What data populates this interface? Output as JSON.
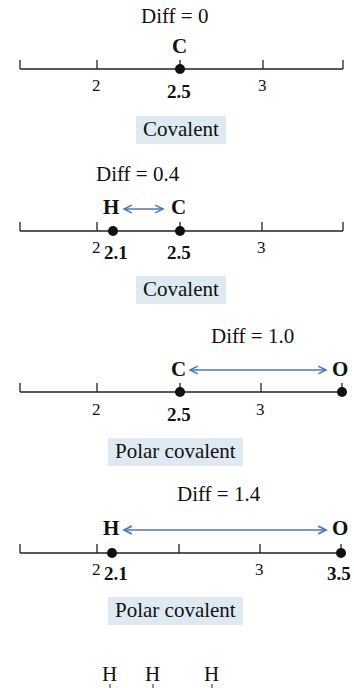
{
  "panels": [
    {
      "diff_label": "Diff = 0",
      "atoms": [
        {
          "symbol": "C",
          "value": "2.5"
        }
      ],
      "bond_type": "Covalent"
    },
    {
      "diff_label": "Diff = 0.4",
      "atoms": [
        {
          "symbol": "H",
          "value": "2.1"
        },
        {
          "symbol": "C",
          "value": "2.5"
        }
      ],
      "bond_type": "Covalent"
    },
    {
      "diff_label": "Diff = 1.0",
      "atoms": [
        {
          "symbol": "C",
          "value": "2.5"
        },
        {
          "symbol": "O",
          "value": ""
        }
      ],
      "bond_type": "Polar covalent"
    },
    {
      "diff_label": "Diff = 1.4",
      "atoms": [
        {
          "symbol": "H",
          "value": "2.1"
        },
        {
          "symbol": "O",
          "value": "3.5"
        }
      ],
      "bond_type": "Polar covalent"
    }
  ],
  "axis": {
    "ticks": [
      "2",
      "3"
    ]
  },
  "bottom_partial": [
    "H",
    "H",
    "H"
  ],
  "colors": {
    "arrow": "#4a78b8",
    "label_bg": "#dfe9f1",
    "line": "#222222"
  }
}
